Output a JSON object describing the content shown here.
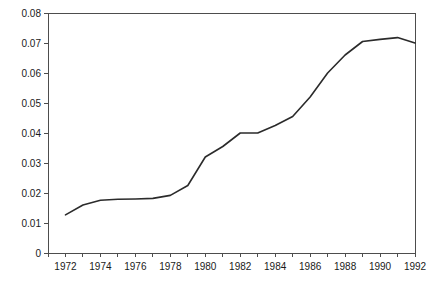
{
  "chart_data": {
    "type": "line",
    "title": "",
    "xlabel": "",
    "ylabel": "",
    "xlim": [
      1971,
      1992
    ],
    "ylim": [
      0,
      0.08
    ],
    "grid": false,
    "legend": null,
    "line_color": "#2b2b2b",
    "axis_color": "#4d4d4d",
    "x_tick_labels": [
      "1972",
      "1974",
      "1976",
      "1978",
      "1980",
      "1982",
      "1984",
      "1986",
      "1988",
      "1990",
      "1992"
    ],
    "x_tick_values": [
      1972,
      1974,
      1976,
      1978,
      1980,
      1982,
      1984,
      1986,
      1988,
      1990,
      1992
    ],
    "x_minor_tick_values": [
      1971,
      1973,
      1975,
      1977,
      1979,
      1981,
      1983,
      1985,
      1987,
      1989,
      1991
    ],
    "y_tick_labels": [
      "0",
      "0.01",
      "0.02",
      "0.03",
      "0.04",
      "0.05",
      "0.06",
      "0.07",
      "0.08"
    ],
    "y_tick_values": [
      0,
      0.01,
      0.02,
      0.03,
      0.04,
      0.05,
      0.06,
      0.07,
      0.08
    ],
    "x": [
      1972,
      1973,
      1974,
      1975,
      1976,
      1977,
      1978,
      1979,
      1980,
      1981,
      1982,
      1983,
      1984,
      1985,
      1986,
      1987,
      1988,
      1989,
      1990,
      1991,
      1992
    ],
    "values": [
      0.0127,
      0.016,
      0.0176,
      0.0179,
      0.018,
      0.0182,
      0.0192,
      0.0225,
      0.032,
      0.0355,
      0.04,
      0.04,
      0.0425,
      0.0455,
      0.052,
      0.06,
      0.066,
      0.0705,
      0.0712,
      0.0718,
      0.07
    ],
    "series": [
      {
        "name": "series-1",
        "values": [
          0.0127,
          0.016,
          0.0176,
          0.0179,
          0.018,
          0.0182,
          0.0192,
          0.0225,
          0.032,
          0.0355,
          0.04,
          0.04,
          0.0425,
          0.0455,
          0.052,
          0.06,
          0.066,
          0.0705,
          0.0712,
          0.0718,
          0.07
        ]
      }
    ]
  }
}
